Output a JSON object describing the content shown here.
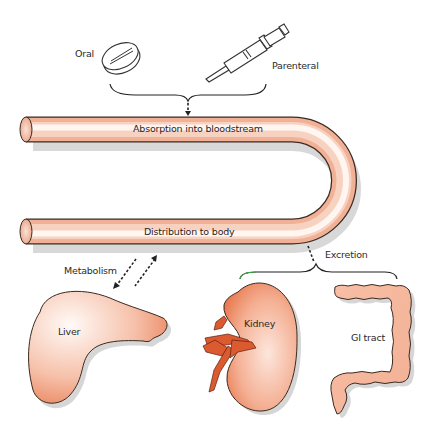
{
  "routes": {
    "oral": {
      "label": "Oral",
      "icon": "pill-icon"
    },
    "parenteral": {
      "label": "Parenteral",
      "icon": "syringe-icon"
    }
  },
  "tube": {
    "absorption_label": "Absorption into bloodstream",
    "distribution_label": "Distribution to body"
  },
  "processes": {
    "metabolism_label": "Metabolism",
    "excretion_label": "Excretion"
  },
  "organs": {
    "liver": {
      "label": "Liver"
    },
    "kidney": {
      "label": "Kidney"
    },
    "gi_tract": {
      "label": "GI tract"
    }
  },
  "colors": {
    "tube_fill_light": "#fdf1ea",
    "tube_fill_dark": "#eea98a",
    "organ_fill_light": "#fbe6dc",
    "organ_fill_dark": "#e8744a",
    "kidney_vessel": "#d9532b",
    "outline": "#3a2a22",
    "shadow": "#cfcfcf"
  }
}
